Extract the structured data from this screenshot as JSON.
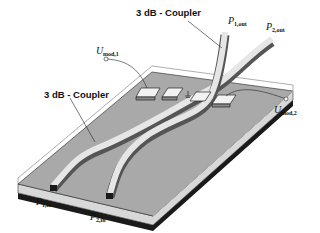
{
  "diagram": {
    "labels": {
      "coupler_top": "3 dB - Coupler",
      "coupler_left": "3 dB - Coupler",
      "p1_out_main": "P",
      "p1_out_sub": "1,out",
      "p2_out_main": "P",
      "p2_out_sub": "2,out",
      "p1_in_main": "P",
      "p1_in_sub": "1,in",
      "p2_in_main": "P",
      "p2_in_sub": "2,in",
      "umod1_main": "U",
      "umod1_sub": "mod,1",
      "umod2_main": "U",
      "umod2_sub": "mod,2"
    },
    "colors": {
      "substrate_top": "#a9a9a9",
      "substrate_side": "#d8d8d8",
      "dark_layer": "#1a1a1a",
      "waveguide": "#e6e6e6",
      "electrode": "#f2f2f2",
      "outline": "#222222"
    }
  }
}
